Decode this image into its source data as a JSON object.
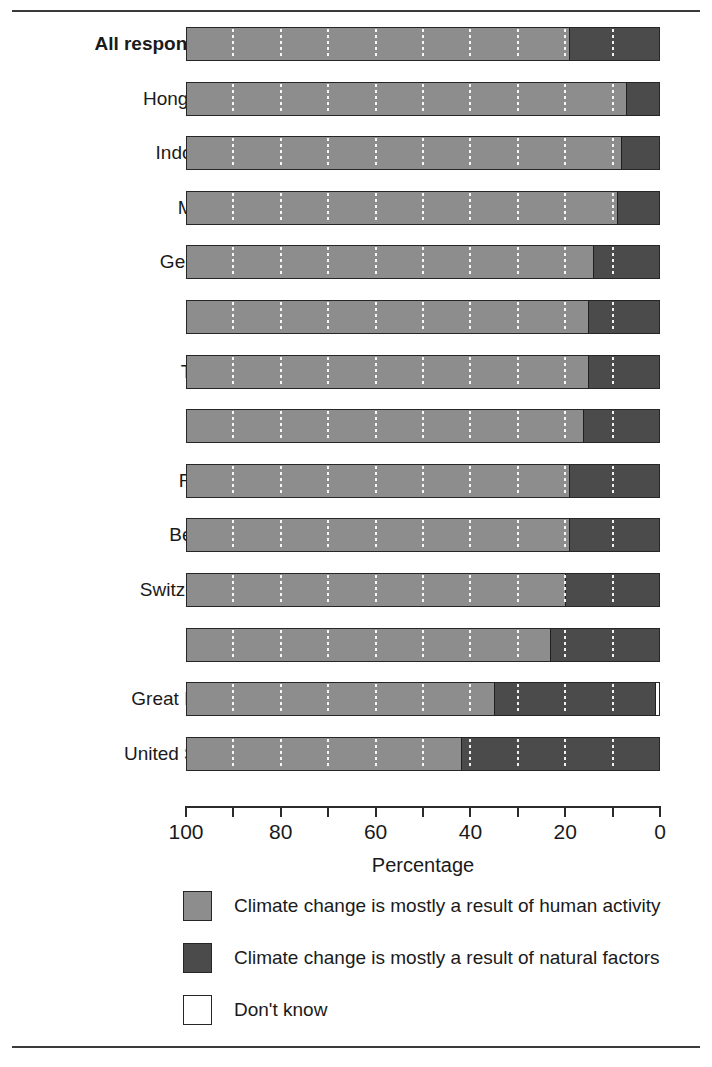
{
  "chart_data": {
    "type": "bar",
    "subtype": "stacked-horizontal-100",
    "title": "",
    "xlabel": "Percentage",
    "ylabel": "",
    "xlim": [
      100,
      0
    ],
    "x_axis_reversed": true,
    "grid": true,
    "gridlines_every": 10,
    "legend_position": "bottom",
    "tick_labels": [
      "100",
      "80",
      "60",
      "40",
      "20",
      "0"
    ],
    "tick_values": [
      100,
      90,
      80,
      70,
      60,
      50,
      40,
      30,
      20,
      10,
      0
    ],
    "categories": [
      "All respondents",
      "Hong Kong",
      "Indonesia",
      "Mexico",
      "Germany",
      "Spain",
      "Turkey",
      "Italy",
      "France",
      "Belgium",
      "Switzerland",
      "Japan",
      "Great Britain",
      "United States"
    ],
    "emphasized_categories": [
      "All respondents"
    ],
    "series": [
      {
        "name": "Climate change is mostly a result of human activity",
        "color": "#8d8d8d",
        "values": [
          81,
          93,
          92,
          91,
          86,
          85,
          85,
          84,
          81,
          81,
          80,
          77,
          65,
          58
        ]
      },
      {
        "name": "Climate change is mostly a result of natural factors",
        "color": "#4b4b4b",
        "values": [
          19,
          7,
          8,
          9,
          14,
          15,
          15,
          16,
          19,
          19,
          20,
          23,
          34,
          42
        ]
      },
      {
        "name": "Don't know",
        "color": "#ffffff",
        "values": [
          0,
          0,
          0,
          0,
          0,
          0,
          0,
          0,
          0,
          0,
          0,
          0,
          1,
          0
        ]
      }
    ]
  },
  "legend": {
    "items": [
      {
        "label": "Climate change is mostly a result of human activity",
        "color": "#8d8d8d"
      },
      {
        "label": "Climate change is mostly a result of natural factors",
        "color": "#4b4b4b"
      },
      {
        "label": "Don't know",
        "color": "#ffffff"
      }
    ]
  },
  "axis": {
    "title": "Percentage"
  }
}
